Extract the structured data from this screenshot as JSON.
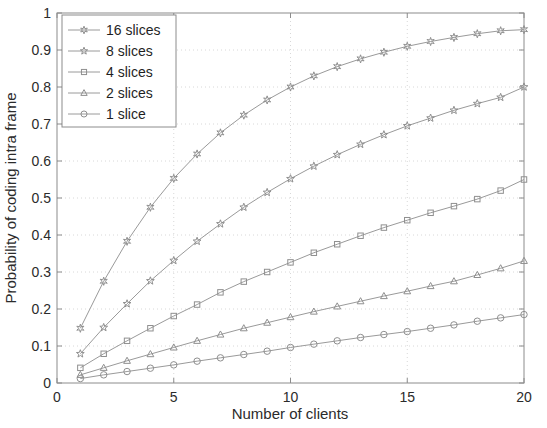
{
  "chart_data": {
    "type": "line",
    "title": "",
    "xlabel": "Number of clients",
    "ylabel": "Probability of coding intra frame",
    "xlim": [
      0,
      20
    ],
    "ylim": [
      0,
      1
    ],
    "xticks": [
      "0",
      "5",
      "10",
      "15",
      "20"
    ],
    "xtick_values": [
      0,
      5,
      10,
      15,
      20
    ],
    "yticks": [
      "0",
      "0.1",
      "0.2",
      "0.3",
      "0.4",
      "0.5",
      "0.6",
      "0.7",
      "0.8",
      "0.9",
      "1"
    ],
    "ytick_values": [
      0,
      0.1,
      0.2,
      0.3,
      0.4,
      0.5,
      0.6,
      0.7,
      0.8,
      0.9,
      1
    ],
    "grid": true,
    "legend_position": "top-left",
    "line_color": "#9a9a9a",
    "marker_color": "#8f8f8f",
    "axis_color": "#8c8c8c",
    "grid_color": "#d8d8d8",
    "x": [
      1,
      2,
      3,
      4,
      5,
      6,
      7,
      8,
      9,
      10,
      11,
      12,
      13,
      14,
      15,
      16,
      17,
      18,
      19,
      20
    ],
    "series": [
      {
        "name": "16 slices",
        "marker": "hexagram",
        "values": [
          0.148,
          0.275,
          0.383,
          0.475,
          0.553,
          0.619,
          0.676,
          0.724,
          0.765,
          0.8,
          0.83,
          0.855,
          0.876,
          0.894,
          0.91,
          0.923,
          0.934,
          0.944,
          0.952,
          0.955
        ]
      },
      {
        "name": "8 slices",
        "marker": "pentagram",
        "values": [
          0.079,
          0.15,
          0.214,
          0.276,
          0.331,
          0.383,
          0.43,
          0.475,
          0.515,
          0.552,
          0.586,
          0.617,
          0.645,
          0.671,
          0.695,
          0.716,
          0.737,
          0.755,
          0.772,
          0.8
        ]
      },
      {
        "name": "4 slices",
        "marker": "square",
        "values": [
          0.041,
          0.079,
          0.114,
          0.148,
          0.181,
          0.212,
          0.245,
          0.274,
          0.3,
          0.326,
          0.352,
          0.375,
          0.398,
          0.42,
          0.44,
          0.46,
          0.478,
          0.497,
          0.52,
          0.55
        ]
      },
      {
        "name": "2 slices",
        "marker": "triangle",
        "values": [
          0.022,
          0.041,
          0.06,
          0.078,
          0.096,
          0.114,
          0.131,
          0.148,
          0.163,
          0.178,
          0.193,
          0.207,
          0.221,
          0.235,
          0.248,
          0.262,
          0.275,
          0.292,
          0.31,
          0.33
        ]
      },
      {
        "name": "1 slice",
        "marker": "circle",
        "values": [
          0.012,
          0.022,
          0.031,
          0.04,
          0.049,
          0.059,
          0.068,
          0.077,
          0.086,
          0.096,
          0.105,
          0.114,
          0.123,
          0.131,
          0.139,
          0.148,
          0.157,
          0.167,
          0.176,
          0.185
        ]
      }
    ]
  },
  "legend": {
    "items": [
      {
        "label": "16 slices"
      },
      {
        "label": "8 slices"
      },
      {
        "label": "4 slices"
      },
      {
        "label": "2 slices"
      },
      {
        "label": "1 slice"
      }
    ]
  }
}
